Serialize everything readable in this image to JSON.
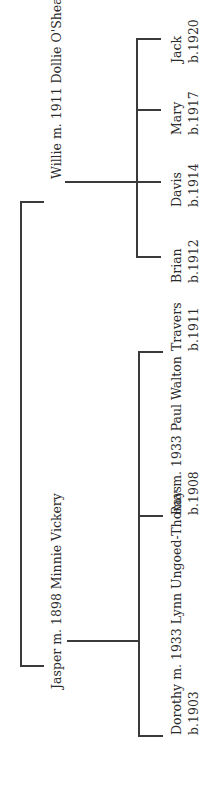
{
  "tree": {
    "root_couples": [
      {
        "label": "Jasper m. 1898 Minnie Vickery",
        "children": [
          {
            "name": "Dorothy m. 1933 Lynn Ungoed-Thomas",
            "born": "b.1903"
          },
          {
            "name": "Ray m. 1933 Paul Walton",
            "born": "b.1908"
          },
          {
            "name": "Travers",
            "born": "b.1911"
          }
        ]
      },
      {
        "label": "Willie m. 1911 Dollie O'Shea",
        "children": [
          {
            "name": "Brian",
            "born": "b.1912"
          },
          {
            "name": "Davis",
            "born": "b.1914"
          },
          {
            "name": "Mary",
            "born": "b.1917"
          },
          {
            "name": "Jack",
            "born": "b.1920"
          }
        ]
      }
    ]
  },
  "colors": {
    "line": "#3a3a3a",
    "text": "#2b2b2b",
    "background": "#ffffff"
  }
}
